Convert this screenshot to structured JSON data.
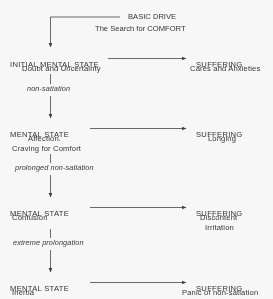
{
  "diagram": {
    "title": {
      "line1": "BASIC DRIVE",
      "line2": "The Search for COMFORT"
    },
    "rows": [
      {
        "state_head": "INITIAL MENTAL STATE",
        "state_sub1": "Doubt and Uncertainty",
        "state_sub2": "",
        "suffering_head": "SUFFERING",
        "suffering_sub1": "Cares and Anxieties",
        "suffering_sub2": ""
      },
      {
        "state_head": "MENTAL STATE",
        "state_sub1": "Affection.",
        "state_sub2": "Craving for Comfort",
        "suffering_head": "SUFFERING",
        "suffering_sub1": "Longing",
        "suffering_sub2": ""
      },
      {
        "state_head": "MENTAL STATE",
        "state_sub1": "Confusion",
        "state_sub2": "",
        "suffering_head": "SUFFERING",
        "suffering_sub1": "Discontent",
        "suffering_sub2": "Irritation"
      },
      {
        "state_head": "MENTAL STATE",
        "state_sub1": "Inertia",
        "state_sub2": "",
        "suffering_head": "SUFFERING",
        "suffering_sub1": "Panic of non-satiation",
        "suffering_sub2": ""
      }
    ],
    "connectors": [
      "non-satiation",
      "prolonged non-satiation",
      "extreme prolongation"
    ],
    "colors": {
      "ink": "#2f2f2f",
      "line": "#4a4a4a",
      "background": "#fdfdfd"
    }
  }
}
